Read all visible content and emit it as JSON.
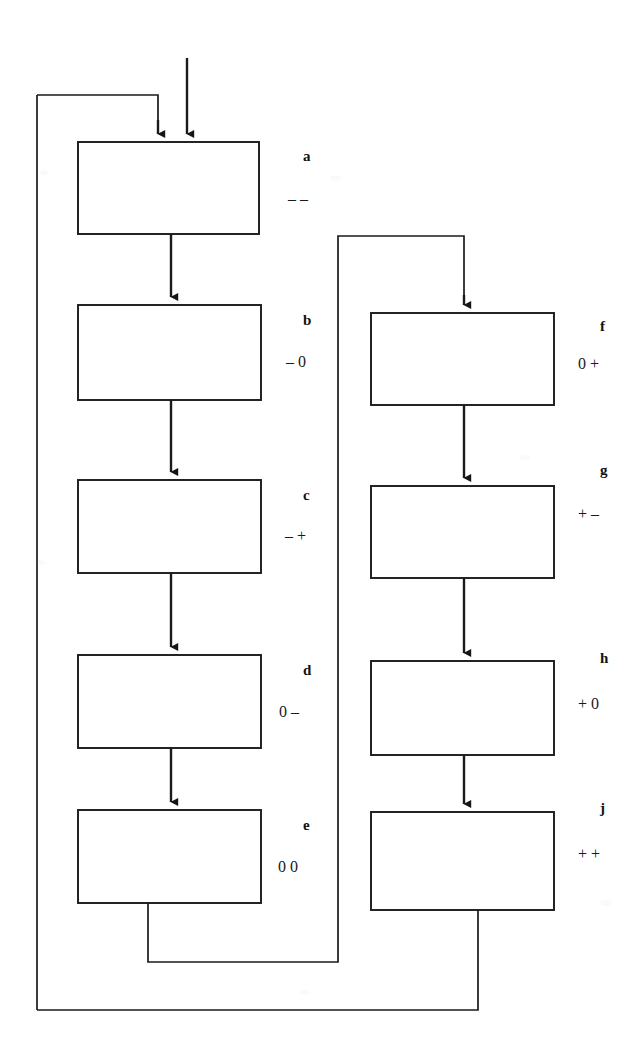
{
  "diagram": {
    "type": "state-sequence-flowchart",
    "background_color": "#ffffff",
    "line_color": "#1a1a1a",
    "box_fill": "#ffffff",
    "boxes": [
      {
        "id": "a",
        "label": "a",
        "code": "– –",
        "column": "left",
        "x": 78,
        "y": 142,
        "w": 181,
        "h": 92
      },
      {
        "id": "b",
        "label": "b",
        "code": "– 0",
        "column": "left",
        "x": 78,
        "y": 305,
        "w": 183,
        "h": 95
      },
      {
        "id": "c",
        "label": "c",
        "code": "– +",
        "column": "left",
        "x": 78,
        "y": 480,
        "w": 183,
        "h": 93
      },
      {
        "id": "d",
        "label": "d",
        "code": "0 –",
        "column": "left",
        "x": 78,
        "y": 655,
        "w": 183,
        "h": 93
      },
      {
        "id": "e",
        "label": "e",
        "code": "0 0",
        "column": "left",
        "x": 78,
        "y": 810,
        "w": 183,
        "h": 93
      },
      {
        "id": "f",
        "label": "f",
        "code": "0 +",
        "column": "right",
        "x": 371,
        "y": 313,
        "w": 183,
        "h": 92
      },
      {
        "id": "g",
        "label": "g",
        "code": "+ –",
        "column": "right",
        "x": 371,
        "y": 486,
        "w": 183,
        "h": 92
      },
      {
        "id": "h",
        "label": "h",
        "code": "+ 0",
        "column": "right",
        "x": 371,
        "y": 661,
        "w": 183,
        "h": 94
      },
      {
        "id": "j",
        "label": "j",
        "code": "+ +",
        "column": "right",
        "x": 371,
        "y": 812,
        "w": 183,
        "h": 98
      }
    ],
    "labels": [
      {
        "for": "a",
        "label_x": 303,
        "label_y": 148,
        "code_x": 288,
        "code_y": 190
      },
      {
        "for": "b",
        "label_x": 303,
        "label_y": 312,
        "code_x": 286,
        "code_y": 353
      },
      {
        "for": "c",
        "label_x": 303,
        "label_y": 487,
        "code_x": 285,
        "code_y": 527
      },
      {
        "for": "d",
        "label_x": 303,
        "label_y": 662,
        "code_x": 279,
        "code_y": 703
      },
      {
        "for": "e",
        "label_x": 303,
        "label_y": 817,
        "code_x": 278,
        "code_y": 858
      },
      {
        "for": "f",
        "label_x": 600,
        "label_y": 318,
        "code_x": 578,
        "code_y": 355
      },
      {
        "for": "g",
        "label_x": 600,
        "label_y": 462,
        "code_x": 578,
        "code_y": 505
      },
      {
        "for": "h",
        "label_x": 600,
        "label_y": 650,
        "code_x": 578,
        "code_y": 695
      },
      {
        "for": "j",
        "label_x": 600,
        "label_y": 800,
        "code_x": 578,
        "code_y": 845
      }
    ],
    "connections": [
      {
        "from": "input",
        "to": "a",
        "kind": "entry-arrow",
        "description": "external input arrow entering box a from top"
      },
      {
        "from": "feedback-loop",
        "to": "a",
        "kind": "loop-arrow",
        "description": "outer feedback loop entering box a from top-left"
      },
      {
        "from": "a",
        "to": "b",
        "kind": "arrow"
      },
      {
        "from": "b",
        "to": "c",
        "kind": "arrow"
      },
      {
        "from": "c",
        "to": "d",
        "kind": "arrow"
      },
      {
        "from": "d",
        "to": "e",
        "kind": "arrow"
      },
      {
        "from": "e",
        "to": "f",
        "kind": "routed-arrow",
        "description": "from bottom of e down, right, up and into top of f"
      },
      {
        "from": "f",
        "to": "g",
        "kind": "arrow"
      },
      {
        "from": "g",
        "to": "h",
        "kind": "arrow"
      },
      {
        "from": "h",
        "to": "j",
        "kind": "arrow"
      },
      {
        "from": "j",
        "to": "a",
        "kind": "routed-loop",
        "description": "from bottom of j down, far left, up to the top feedback line into a"
      }
    ]
  }
}
